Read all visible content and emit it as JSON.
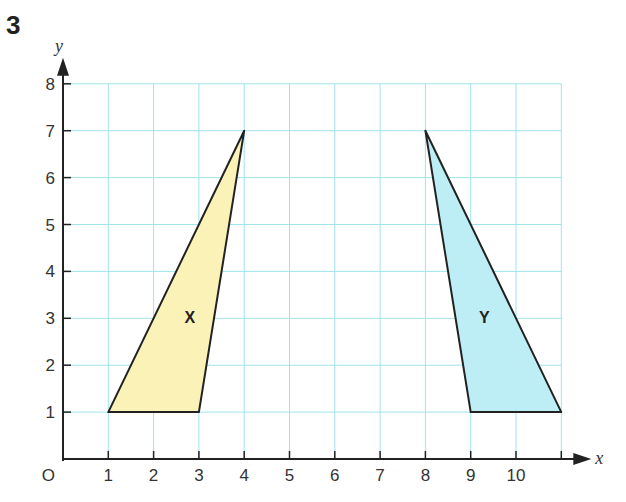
{
  "question_number": "3",
  "chart_data": {
    "type": "coordinate-grid",
    "title": "",
    "xlabel": "x",
    "ylabel": "y",
    "origin_label": "O",
    "xlim": [
      0,
      11
    ],
    "ylim": [
      0,
      8
    ],
    "x_ticks": [
      1,
      2,
      3,
      4,
      5,
      6,
      7,
      8,
      9,
      10
    ],
    "y_ticks": [
      1,
      2,
      3,
      4,
      5,
      6,
      7,
      8
    ],
    "grid": true,
    "shapes": [
      {
        "label": "X",
        "type": "triangle",
        "vertices": [
          [
            1,
            1
          ],
          [
            3,
            1
          ],
          [
            4,
            7
          ]
        ],
        "fill": "#fbf2b8",
        "label_pos": [
          2.8,
          2.9
        ]
      },
      {
        "label": "Y",
        "type": "triangle",
        "vertices": [
          [
            8,
            7
          ],
          [
            9,
            1
          ],
          [
            11,
            1
          ]
        ],
        "fill": "#bdeef6",
        "label_pos": [
          9.3,
          2.9
        ]
      }
    ]
  },
  "colors": {
    "grid": "#9fe3ec",
    "axis": "#222222",
    "shape_stroke": "#222222"
  }
}
